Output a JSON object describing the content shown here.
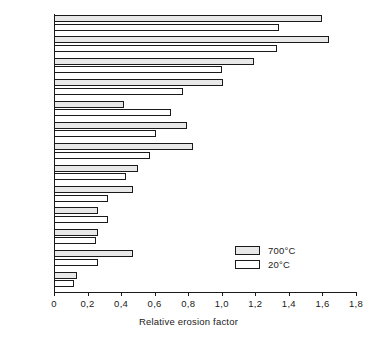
{
  "chart_data": {
    "type": "bar",
    "orientation": "horizontal",
    "title": "",
    "xlabel": "Relative erosion factor",
    "ylabel": "",
    "xlim": [
      0,
      1.8
    ],
    "xticks": [
      "0",
      "0,2",
      "0,4",
      "0,6",
      "0,8",
      "1,0",
      "1,2",
      "1,4",
      "1,6",
      "1,8"
    ],
    "xtick_values": [
      0,
      0.2,
      0.4,
      0.6,
      0.8,
      1.0,
      1.2,
      1.4,
      1.6,
      1.8
    ],
    "grid": false,
    "legend_position": "inside-lower-right",
    "categories": [
      "K-151A",
      "K-162B",
      "K-90",
      "K-86",
      "W-10",
      "3109",
      "K-94",
      "K-68",
      "3406",
      "K-801",
      "K-714",
      "K-701",
      "K-602"
    ],
    "series": [
      {
        "name": "700°C",
        "values": [
          1.6,
          1.64,
          1.19,
          1.01,
          0.42,
          0.79,
          0.83,
          0.5,
          0.47,
          0.26,
          0.26,
          0.47,
          0.14
        ]
      },
      {
        "name": "20°C",
        "values": [
          1.34,
          1.33,
          1.0,
          0.77,
          0.7,
          0.61,
          0.57,
          0.43,
          0.32,
          0.32,
          0.25,
          0.26,
          0.12
        ]
      }
    ]
  },
  "legend": {
    "entries": [
      {
        "label": "700°C",
        "style": "hatched"
      },
      {
        "label": "20°C",
        "style": "white"
      }
    ]
  }
}
